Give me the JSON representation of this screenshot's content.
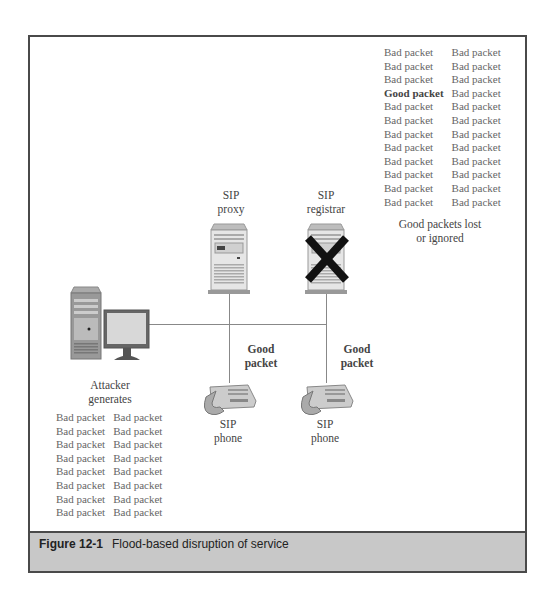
{
  "diagram": {
    "top_right_packets": {
      "col1": [
        "Bad packet",
        "Bad packet",
        "Bad packet",
        "Good packet",
        "Bad packet",
        "Bad packet",
        "Bad packet",
        "Bad packet",
        "Bad packet",
        "Bad packet",
        "Bad packet",
        "Bad packet"
      ],
      "col2": [
        "Bad packet",
        "Bad packet",
        "Bad packet",
        "Bad packet",
        "Bad packet",
        "Bad packet",
        "Bad packet",
        "Bad packet",
        "Bad packet",
        "Bad packet",
        "Bad packet",
        "Bad packet"
      ],
      "note_line1": "Good packets lost",
      "note_line2": "or ignored"
    },
    "sip_proxy": {
      "line1": "SIP",
      "line2": "proxy",
      "icon": "server-icon"
    },
    "sip_registrar": {
      "line1": "SIP",
      "line2": "registrar",
      "icon": "server-icon",
      "status": "disabled-x"
    },
    "attacker": {
      "line1": "Attacker",
      "line2": "generates",
      "icon": "computer-icon"
    },
    "phone_left": {
      "line1": "SIP",
      "line2": "phone",
      "packet_line1": "Good",
      "packet_line2": "packet",
      "icon": "phone-icon"
    },
    "phone_right": {
      "line1": "SIP",
      "line2": "phone",
      "packet_line1": "Good",
      "packet_line2": "packet",
      "icon": "phone-icon"
    },
    "bottom_left_packets": {
      "col1": [
        "Bad packet",
        "Bad packet",
        "Bad packet",
        "Bad packet",
        "Bad packet",
        "Bad packet",
        "Bad packet",
        "Bad packet"
      ],
      "col2": [
        "Bad packet",
        "Bad packet",
        "Bad packet",
        "Bad packet",
        "Bad packet",
        "Bad packet",
        "Bad packet",
        "Bad packet"
      ]
    }
  },
  "caption": {
    "label": "Figure 12-1",
    "text": "Flood-based disruption of service"
  },
  "colors": {
    "border": "#4a4a4a",
    "caption_bg": "#c8c8c8",
    "x_mark": "#111111"
  }
}
